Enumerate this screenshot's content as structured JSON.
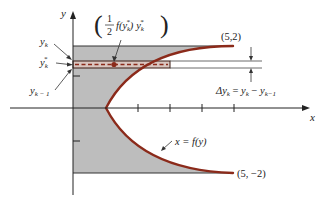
{
  "figure": {
    "axes": {
      "x_label": "x",
      "y_label": "y"
    },
    "curve": {
      "label": "x = f(y)",
      "equation": "x = 1 + y^2",
      "color": "#8b2a1a"
    },
    "points": [
      {
        "label": "(5,2)",
        "x": 5,
        "y": 2
      },
      {
        "label": "(5, −2)",
        "x": 5,
        "y": -2
      }
    ],
    "strip_labels": {
      "y_k": "y",
      "y_k_sub": "k",
      "y_k_star": "y",
      "y_k_star_sub": "k",
      "y_k_star_sup": "*",
      "y_k_minus_1": "y",
      "y_k_minus_1_sub": "k − 1"
    },
    "centroid_label": {
      "open_paren": "(",
      "frac_num": "1",
      "frac_den": "2",
      "f_part": "f(y",
      "f_sub": "k",
      "f_sup": "*",
      "f_close": ")",
      "y_part": "y",
      "y_sub": "k",
      "y_sup": "*",
      "close_paren": ")"
    },
    "delta_label": {
      "delta": "Δy",
      "delta_sub": "k",
      "equals": " = ",
      "y1": "y",
      "y1_sub": "k",
      "minus": " − ",
      "y2": "y",
      "y2_sub": "k−1"
    },
    "colors": {
      "shade": "#bdbdbd",
      "curve": "#8b2a1a",
      "strip_fill": "#d9c6c0",
      "axis": "#222222"
    }
  }
}
